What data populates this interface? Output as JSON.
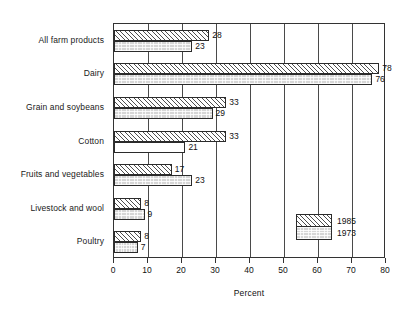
{
  "chart_data": {
    "type": "bar",
    "orientation": "horizontal",
    "title": "",
    "subtitle": "",
    "xlabel": "Percent",
    "ylabel": "",
    "xlim": [
      0,
      80
    ],
    "xticks": [
      0,
      10,
      20,
      30,
      40,
      50,
      60,
      70,
      80
    ],
    "grid": true,
    "grid_axis": "x",
    "legend_position": "inside-right",
    "categories": [
      "All farm products",
      "Dairy",
      "Grain and soybeans",
      "Cotton",
      "Fruits and vegetables",
      "Livestock and wool",
      "Poultry"
    ],
    "series": [
      {
        "name": "1985",
        "pattern": "diagonal-hatch",
        "values": [
          28,
          78,
          33,
          33,
          17,
          8,
          8
        ]
      },
      {
        "name": "1973",
        "pattern": "gray-stipple",
        "values": [
          23,
          76,
          29,
          21,
          23,
          9,
          7
        ]
      }
    ]
  },
  "legend": {
    "entries": [
      {
        "label": "1985"
      },
      {
        "label": "1973"
      }
    ]
  },
  "axis": {
    "x_title": "Percent",
    "tick_labels": [
      "0",
      "10",
      "20",
      "30",
      "40",
      "50",
      "60",
      "70",
      "80"
    ]
  },
  "colors": {
    "frame": "#333333",
    "gridline": "#4a4a4a",
    "bar_outline": "#2b2b2b",
    "series_1985_fill": "#ffffff",
    "series_1973_fill": "#d6d6d6",
    "text": "#111111"
  }
}
